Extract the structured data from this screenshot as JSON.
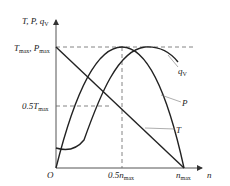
{
  "diagram": {
    "y_axis_label": "T, P, q",
    "y_axis_label_sub": "V",
    "x_axis_label": "n",
    "origin_label": "O",
    "y_ticks": [
      {
        "main": "T",
        "sub": "max",
        "main2": ", P",
        "sub2": "max"
      },
      {
        "main": "0.5T",
        "sub": "max"
      }
    ],
    "x_ticks": [
      {
        "main": "0.5n",
        "sub": "max"
      },
      {
        "main": "n",
        "sub": "max"
      }
    ],
    "curves": [
      {
        "name": "T",
        "label": "T",
        "shape": "linear decreasing from T_max at n=0 to 0 at n_max"
      },
      {
        "name": "P",
        "label": "P",
        "shape": "parabola, 0 at n=0 and n_max, peak P_max at 0.5 n_max"
      },
      {
        "name": "q_V",
        "label": "q",
        "label_sub": "V",
        "shape": "rises to max near 0.7 n_max then declines"
      }
    ],
    "colors": {
      "curve": "#222222",
      "axis": "#555555",
      "dash": "#666666",
      "leader": "#777777"
    }
  }
}
